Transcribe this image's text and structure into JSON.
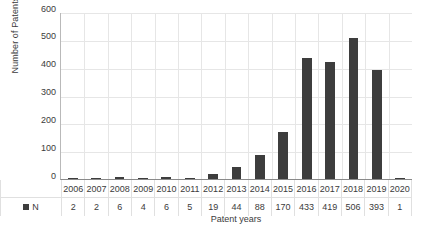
{
  "chart_data": {
    "type": "bar",
    "title": "",
    "xlabel": "Patent years",
    "ylabel": "Number of Patents",
    "categories": [
      "2006",
      "2007",
      "2008",
      "2009",
      "2010",
      "2011",
      "2012",
      "2013",
      "2014",
      "2015",
      "2016",
      "2017",
      "2018",
      "2019",
      "2020"
    ],
    "values": [
      2,
      2,
      6,
      4,
      6,
      5,
      19,
      44,
      88,
      170,
      433,
      419,
      506,
      393,
      1
    ],
    "series": [
      {
        "name": "N",
        "values": [
          2,
          2,
          6,
          4,
          6,
          5,
          19,
          44,
          88,
          170,
          433,
          419,
          506,
          393,
          1
        ],
        "color": "#3d3d3d"
      }
    ],
    "ylim": [
      0,
      600
    ],
    "yticks": [
      0,
      100,
      200,
      300,
      400,
      500,
      600
    ],
    "ytick_labels": [
      "0",
      "100",
      "200",
      "300",
      "400",
      "500",
      "600"
    ],
    "grid": true,
    "legend_position": "bottom-left-table",
    "legend_entries": [
      "N"
    ],
    "data_table": {
      "row_label": "N",
      "header": [
        "2006",
        "2007",
        "2008",
        "2009",
        "2010",
        "2011",
        "2012",
        "2013",
        "2014",
        "2015",
        "2016",
        "2017",
        "2018",
        "2019",
        "2020"
      ],
      "values": [
        "2",
        "2",
        "6",
        "4",
        "6",
        "5",
        "19",
        "44",
        "88",
        "170",
        "433",
        "419",
        "506",
        "393",
        "1"
      ]
    }
  },
  "colors": {
    "bar": "#3d3d3d",
    "gridline": "#e6e6e6",
    "axis": "#8a8a8a",
    "text": "#3b3b3b",
    "background": "#ffffff"
  }
}
